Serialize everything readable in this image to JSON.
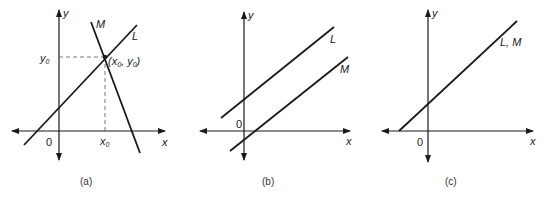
{
  "colors": {
    "ink": "#1a1a1a",
    "background": "#ffffff"
  },
  "panels": [
    {
      "caption": "(a)",
      "axis_x_label": "x",
      "axis_y_label": "y",
      "origin_label": "0",
      "line_L_label": "L",
      "line_M_label": "M",
      "point_label_open": "(x",
      "point_label_sub1": "0",
      "point_label_mid": ", y",
      "point_label_sub2": "0",
      "point_label_close": ")",
      "y0_label": "y",
      "y0_sub": "0",
      "x0_label": "x",
      "x0_sub": "0",
      "description": "Lines L and M intersect at a single point (x0, y0)"
    },
    {
      "caption": "(b)",
      "axis_x_label": "x",
      "axis_y_label": "y",
      "origin_label": "0",
      "line_L_label": "L",
      "line_M_label": "M",
      "description": "Lines L and M are parallel and do not intersect"
    },
    {
      "caption": "(c)",
      "axis_x_label": "x",
      "axis_y_label": "y",
      "origin_label": "0",
      "line_LM_label": "L, M",
      "description": "Lines L and M coincide"
    }
  ]
}
